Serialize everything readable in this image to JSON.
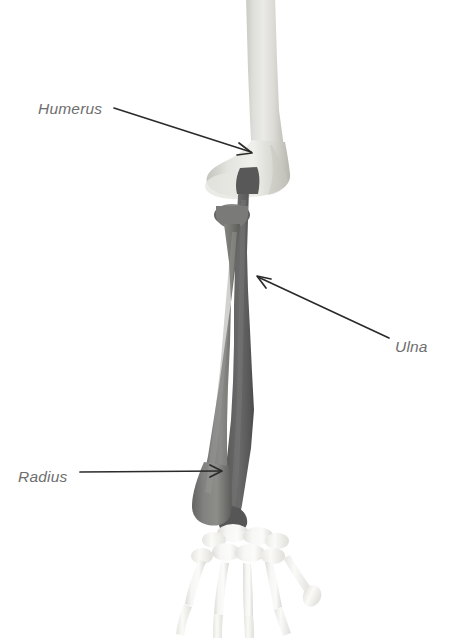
{
  "figure": {
    "background_color": "#ffffff",
    "width": 449,
    "height": 638
  },
  "labels": [
    {
      "id": "humerus",
      "text": "Humerus",
      "text_x": 38,
      "text_y": 114,
      "color": "#6e6e6e",
      "leader": {
        "x1": 114,
        "y1": 108,
        "x2": 251,
        "y2": 152
      },
      "arrow_direction": "down-right"
    },
    {
      "id": "ulna",
      "text": "Ulna",
      "text_x": 395,
      "text_y": 352,
      "color": "#6e6e6e",
      "leader": {
        "x1": 389,
        "y1": 338,
        "x2": 258,
        "y2": 277
      },
      "arrow_direction": "up-left"
    },
    {
      "id": "radius",
      "text": "Radius",
      "text_x": 18,
      "text_y": 482,
      "color": "#6e6e6e",
      "leader": {
        "x1": 80,
        "y1": 472,
        "x2": 221,
        "y2": 471
      },
      "arrow_direction": "right"
    }
  ],
  "bones": [
    {
      "id": "humerus",
      "name": "Humerus",
      "description": "Upper arm bone, light grey, vertical shaft flaring into distal condyles at the elbow",
      "fill_light": "#e2e2de",
      "fill_mid": "#d2d2cd",
      "fill_dark": "#bdbdb7"
    },
    {
      "id": "ulna",
      "name": "Ulna",
      "description": "Darkest grey forearm bone on the lateral side running from the olecranon at the elbow down to the wrist",
      "fill_light": "#6d6d6d",
      "fill_mid": "#5a5a5a",
      "fill_dark": "#4a4a4a"
    },
    {
      "id": "radius",
      "name": "Radius",
      "description": "Medium grey forearm bone with a rounded head at the elbow widening into a broad distal end at the wrist",
      "fill_light": "#8a8a88",
      "fill_mid": "#767674",
      "fill_dark": "#656563"
    },
    {
      "id": "hand",
      "name": "Carpals, metacarpals and phalanges",
      "description": "Very pale off-white bones of the wrist and hand fanning out at the bottom of the figure",
      "fill_light": "#fbfbfa",
      "fill_mid": "#ededea",
      "fill_dark": "#dddcd8"
    }
  ]
}
